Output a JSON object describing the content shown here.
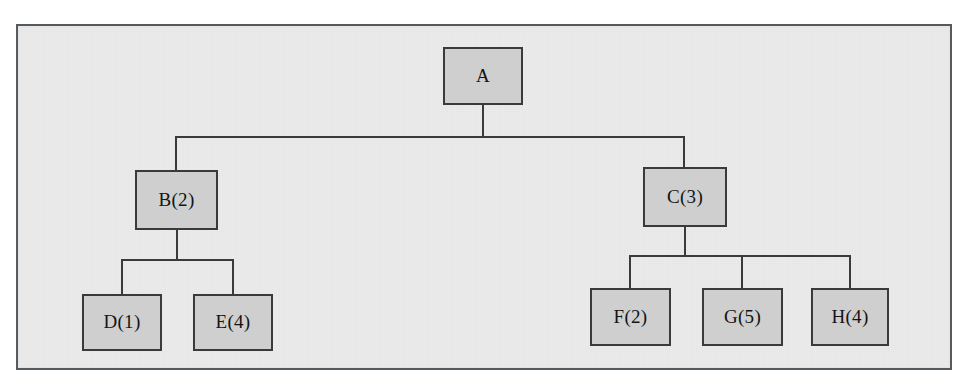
{
  "document": {
    "kind": "scanned-figure",
    "background_color": "#ffffff",
    "page_color": "#ebebeb",
    "border_color": "#555b5e"
  },
  "diagram": {
    "type": "tree",
    "node_fill": "#cfcfcf",
    "node_border": "#3a3a3a",
    "edge_color": "#3a3a3a",
    "nodes": [
      {
        "id": "A",
        "label": "A",
        "x": 443,
        "y": 47,
        "w": 80,
        "h": 58,
        "level": 0,
        "parent": null
      },
      {
        "id": "B",
        "label": "B(2)",
        "x": 135,
        "y": 170,
        "w": 83,
        "h": 60,
        "level": 1,
        "parent": "A"
      },
      {
        "id": "C",
        "label": "C(3)",
        "x": 643,
        "y": 167,
        "w": 84,
        "h": 60,
        "level": 1,
        "parent": "A"
      },
      {
        "id": "D",
        "label": "D(1)",
        "x": 82,
        "y": 294,
        "w": 80,
        "h": 57,
        "level": 2,
        "parent": "B"
      },
      {
        "id": "E",
        "label": "E(4)",
        "x": 193,
        "y": 294,
        "w": 80,
        "h": 57,
        "level": 2,
        "parent": "B"
      },
      {
        "id": "F",
        "label": "F(2)",
        "x": 590,
        "y": 288,
        "w": 81,
        "h": 58,
        "level": 2,
        "parent": "C"
      },
      {
        "id": "G",
        "label": "G(5)",
        "x": 702,
        "y": 288,
        "w": 81,
        "h": 58,
        "level": 2,
        "parent": "C"
      },
      {
        "id": "H",
        "label": "H(4)",
        "x": 811,
        "y": 288,
        "w": 78,
        "h": 58,
        "level": 2,
        "parent": "C"
      }
    ],
    "edges": [
      {
        "from": "A",
        "to": "B"
      },
      {
        "from": "A",
        "to": "C"
      },
      {
        "from": "B",
        "to": "D"
      },
      {
        "from": "B",
        "to": "E"
      },
      {
        "from": "C",
        "to": "F"
      },
      {
        "from": "C",
        "to": "G"
      },
      {
        "from": "C",
        "to": "H"
      }
    ]
  },
  "labels": {
    "a": "A",
    "b": "B(2)",
    "c": "C(3)",
    "d": "D(1)",
    "e": "E(4)",
    "f": "F(2)",
    "g": "G(5)",
    "h": "H(4)"
  }
}
